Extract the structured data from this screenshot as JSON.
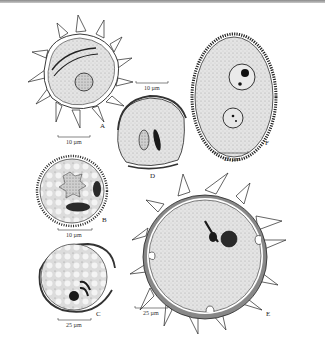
{
  "figure": {
    "panels": [
      {
        "id": "A",
        "label": "A",
        "scale": "10 µm"
      },
      {
        "id": "B",
        "label": "B",
        "scale": "10 µm"
      },
      {
        "id": "C",
        "label": "C",
        "scale": "25 µm"
      },
      {
        "id": "D",
        "label": "D",
        "scale": "10 µm"
      },
      {
        "id": "E",
        "label": "E",
        "scale": "25 µm"
      },
      {
        "id": "F",
        "label": "F",
        "scale": "25 µm"
      }
    ]
  },
  "colors": {
    "ink": "#1a1a1a",
    "cytoplasm": "#d9d9d9",
    "wall": "#8a8a8a",
    "nucleus": "#333333",
    "background": "#ffffff"
  }
}
